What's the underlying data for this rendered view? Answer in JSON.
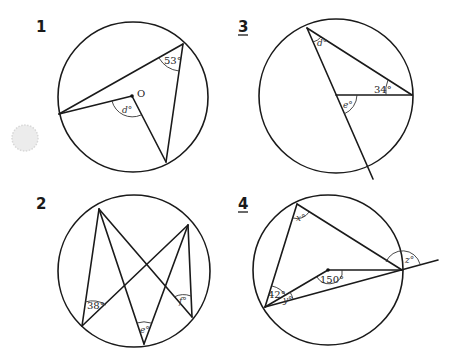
{
  "page": {
    "background": "#ffffff",
    "line_color": "#1a1a1a"
  },
  "diagrams": [
    {
      "number": "1",
      "labels": {
        "given_angle": "53°",
        "unknown": "d°",
        "center": "O"
      }
    },
    {
      "number": "2",
      "labels": {
        "given_angle": "38°",
        "unknown_1": "e°",
        "unknown_2": "f°"
      }
    },
    {
      "number": "3",
      "labels": {
        "given_angle": "34°",
        "unknown_1": "d°",
        "unknown_2": "e°"
      }
    },
    {
      "number": "4",
      "labels": {
        "given_angle_1": "42°",
        "given_angle_2": "150°",
        "unknown_1": "x°",
        "unknown_2": "y°",
        "unknown_3": "z°"
      }
    }
  ]
}
